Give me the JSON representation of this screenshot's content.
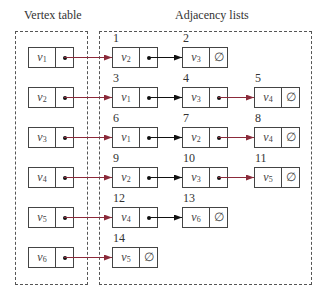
{
  "headings": {
    "vertex_table": "Vertex table",
    "adjacency_lists": "Adjacency lists"
  },
  "colors": {
    "head_arrow": "#8b2a3a",
    "link_arrow": "#111111",
    "border": "#444444"
  },
  "vertex_table": [
    {
      "name": "v",
      "sub": "1",
      "points_to": 1
    },
    {
      "name": "v",
      "sub": "2",
      "points_to": 3
    },
    {
      "name": "v",
      "sub": "3",
      "points_to": 6
    },
    {
      "name": "v",
      "sub": "4",
      "points_to": 9
    },
    {
      "name": "v",
      "sub": "5",
      "points_to": 12
    },
    {
      "name": "v",
      "sub": "6",
      "points_to": 14
    }
  ],
  "adjacency_lists": [
    [
      {
        "index": "1",
        "name": "v",
        "sub": "2",
        "next": "•"
      },
      {
        "index": "2",
        "name": "v",
        "sub": "3",
        "next": "∅"
      }
    ],
    [
      {
        "index": "3",
        "name": "v",
        "sub": "1",
        "next": "•"
      },
      {
        "index": "4",
        "name": "v",
        "sub": "3",
        "next": "•"
      },
      {
        "index": "5",
        "name": "v",
        "sub": "4",
        "next": "∅"
      }
    ],
    [
      {
        "index": "6",
        "name": "v",
        "sub": "1",
        "next": "•"
      },
      {
        "index": "7",
        "name": "v",
        "sub": "2",
        "next": "•"
      },
      {
        "index": "8",
        "name": "v",
        "sub": "4",
        "next": "∅"
      }
    ],
    [
      {
        "index": "9",
        "name": "v",
        "sub": "2",
        "next": "•"
      },
      {
        "index": "10",
        "name": "v",
        "sub": "3",
        "next": "•"
      },
      {
        "index": "11",
        "name": "v",
        "sub": "5",
        "next": "∅"
      }
    ],
    [
      {
        "index": "12",
        "name": "v",
        "sub": "4",
        "next": "•"
      },
      {
        "index": "13",
        "name": "v",
        "sub": "6",
        "next": "∅"
      }
    ],
    [
      {
        "index": "14",
        "name": "v",
        "sub": "5",
        "next": "∅"
      }
    ]
  ],
  "null_symbol": "∅"
}
